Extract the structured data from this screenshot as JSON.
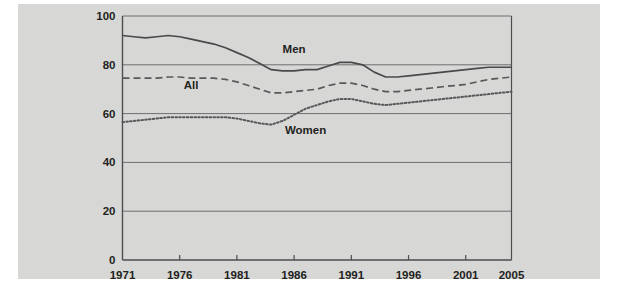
{
  "figure": {
    "background_color": "#d7d8d6",
    "page_color": "#ffffff",
    "axis_color": "#4d4d4f",
    "grid_color": "#6d6e71",
    "text_color": "#231f20"
  },
  "chart_data": {
    "type": "line",
    "title": "",
    "subtitle": "",
    "xlabel": "",
    "ylabel": "",
    "xlim": [
      1971,
      2005
    ],
    "ylim": [
      0,
      100
    ],
    "grid": true,
    "grid_axis": "y",
    "legend_position": "inline-annotations",
    "x_tick_labels": [
      "1971",
      "1976",
      "1981",
      "1986",
      "1991",
      "1996",
      "2001",
      "2005"
    ],
    "x_ticks": [
      1971,
      1976,
      1981,
      1986,
      1991,
      1996,
      2001,
      2005
    ],
    "y_tick_labels": [
      "0",
      "20",
      "40",
      "60",
      "80",
      "100"
    ],
    "y_ticks": [
      0,
      20,
      40,
      60,
      80,
      100
    ],
    "x": [
      1971,
      1972,
      1973,
      1974,
      1975,
      1976,
      1977,
      1978,
      1979,
      1980,
      1981,
      1982,
      1983,
      1984,
      1985,
      1986,
      1987,
      1988,
      1989,
      1990,
      1991,
      1992,
      1993,
      1994,
      1995,
      1996,
      1997,
      1998,
      1999,
      2000,
      2001,
      2002,
      2003,
      2004,
      2005
    ],
    "series": [
      {
        "name": "Men",
        "label": "Men",
        "style": "solid",
        "color": "#4a4a4c",
        "label_x": 1986,
        "label_y": 85,
        "values": [
          92,
          91.5,
          91,
          91.5,
          92,
          91.5,
          90.5,
          89.5,
          88.5,
          87,
          85,
          83,
          80.5,
          78,
          77.5,
          77.5,
          78,
          78,
          79.5,
          81,
          81,
          80,
          77,
          75,
          75,
          75.5,
          76,
          76.5,
          77,
          77.5,
          78,
          78.5,
          79,
          79,
          79
        ]
      },
      {
        "name": "All",
        "label": "All",
        "style": "dashed",
        "color": "#58585b",
        "label_x": 1977,
        "label_y": 70,
        "values": [
          74.5,
          74.5,
          74.5,
          74.5,
          75,
          75,
          74.5,
          74.5,
          74.5,
          74,
          73,
          71.5,
          70,
          68.5,
          68.5,
          69,
          69.5,
          70,
          71.5,
          72.5,
          72.5,
          71.5,
          70,
          69,
          69,
          69.5,
          70,
          70.5,
          71,
          71.5,
          72,
          73,
          74,
          74.5,
          75
        ]
      },
      {
        "name": "Women",
        "label": "Women",
        "style": "dotted",
        "color": "#58585b",
        "label_x": 1987,
        "label_y": 51.5,
        "values": [
          56.5,
          57,
          57.5,
          58,
          58.5,
          58.5,
          58.5,
          58.5,
          58.5,
          58.5,
          58,
          57,
          56,
          55.5,
          57,
          59.5,
          62,
          63.5,
          65,
          66,
          66,
          65,
          64,
          63.5,
          64,
          64.5,
          65,
          65.5,
          66,
          66.5,
          67,
          67.5,
          68,
          68.5,
          69
        ]
      }
    ]
  }
}
